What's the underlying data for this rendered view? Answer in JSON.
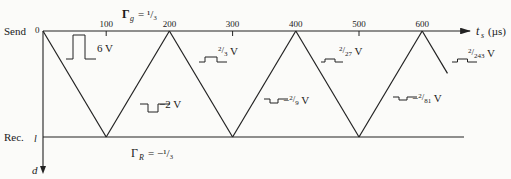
{
  "diagram": {
    "type": "bounce-diagram",
    "send_label": "Send",
    "receive_label": "Rec.",
    "distance_end_label": "l",
    "distance_axis_label": "d",
    "time_axis_label_main": "t",
    "time_axis_label_sub": "s",
    "time_axis_units": "(µs)",
    "origin_label": "0",
    "gamma_g": {
      "symbol": "Γ",
      "sub": "g",
      "value_text": "= ¹/₃"
    },
    "gamma_r": {
      "symbol": "Γ",
      "sub": "R",
      "value_text": "= −¹/₃"
    },
    "time_ticks": [
      "0",
      "100",
      "200",
      "300",
      "400",
      "500",
      "600"
    ],
    "time_tick_values": [
      0,
      100,
      200,
      300,
      400,
      500,
      600
    ],
    "bounce_times": [
      0,
      100,
      200,
      300,
      400,
      500,
      600
    ],
    "final_partial_time": 640,
    "pulses": [
      {
        "label": "6 V",
        "polarity": "positive",
        "relative_amplitude": 1.0,
        "segment": 1
      },
      {
        "label": "−2 V",
        "polarity": "negative",
        "relative_amplitude": 0.333,
        "segment": 2
      },
      {
        "label_num": "2",
        "label_den": "3",
        "prefix": "",
        "suffix": " V",
        "polarity": "positive",
        "relative_amplitude": 0.111,
        "segment": 3
      },
      {
        "label_num": "2",
        "label_den": "9",
        "prefix": "−",
        "suffix": " V",
        "polarity": "negative",
        "relative_amplitude": 0.037,
        "segment": 4
      },
      {
        "label_num": "2",
        "label_den": "27",
        "prefix": "",
        "suffix": " V",
        "polarity": "positive",
        "relative_amplitude": 0.012,
        "segment": 5
      },
      {
        "label_num": "2",
        "label_den": "81",
        "prefix": "−",
        "suffix": " V",
        "polarity": "negative",
        "relative_amplitude": 0.004,
        "segment": 6
      },
      {
        "label_num": "2",
        "label_den": "243",
        "prefix": "",
        "suffix": " V",
        "polarity": "positive",
        "relative_amplitude": 0.0014,
        "segment": 7
      }
    ]
  }
}
